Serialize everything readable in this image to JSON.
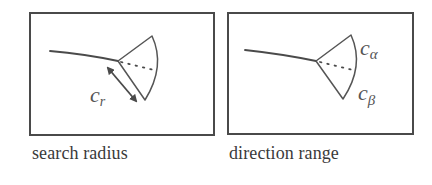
{
  "figure": {
    "panels": [
      {
        "id": "search-radius",
        "caption": "search radius",
        "labels": {
          "radius_symbol": "c",
          "radius_subscript": "r"
        }
      },
      {
        "id": "direction-range",
        "caption": "direction range",
        "labels": {
          "alpha_symbol": "c",
          "alpha_subscript": "α",
          "beta_symbol": "c",
          "beta_subscript": "β"
        }
      }
    ]
  },
  "colors": {
    "stroke": "#4a4a4a",
    "label": "#555555",
    "caption": "#3a3a3a",
    "background": "#ffffff"
  }
}
